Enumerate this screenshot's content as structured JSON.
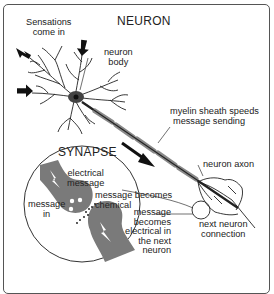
{
  "diagram": {
    "title": "NEURON",
    "inset_title": "SYNAPSE",
    "labels": {
      "sensations": [
        "Sensations",
        "come in"
      ],
      "neuron_body": [
        "neuron",
        "body"
      ],
      "myelin": [
        "myelin sheath speeds",
        "message sending"
      ],
      "axon": "neuron axon",
      "next_connection": [
        "next neuron",
        "connection"
      ],
      "electrical_message": [
        "electrical",
        "message"
      ],
      "message_in": [
        "message",
        "in"
      ],
      "becomes_chemical": [
        "message becomes",
        "chemical"
      ],
      "becomes_electrical": [
        "message",
        "becomes",
        "electrical in",
        "the next",
        "neuron"
      ]
    },
    "colors": {
      "ink": "#222222",
      "synapse_fill": "#7a7a7a",
      "myelin": "#8a8a8a",
      "frame": "#555555"
    }
  }
}
